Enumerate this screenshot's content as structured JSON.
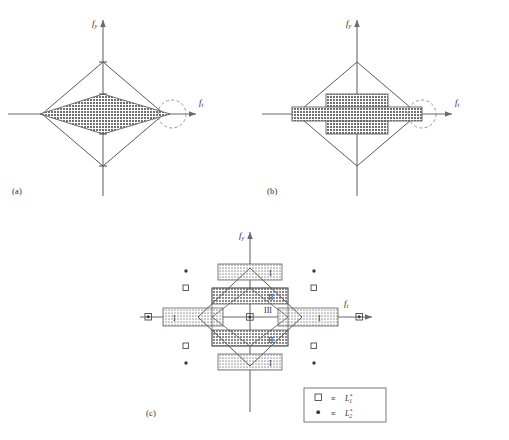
{
  "figure": {
    "type": "diagram",
    "caption_panels": [
      "(a)",
      "(b)",
      "(c)"
    ],
    "axis": {
      "x_label_base": "f",
      "x_label_sub": "t",
      "y_label_base": "f",
      "y_label_sub": "y"
    },
    "panels": [
      {
        "id": "a",
        "label": "(a)",
        "description": "Outer diamond envelope with an inner shaded lens/diamond region, dashed circle at right vertex",
        "outer_shape": "diamond",
        "inner_shape": "shaded-diamond",
        "dashed_circle": true
      },
      {
        "id": "b",
        "label": "(b)",
        "description": "Outer diamond envelope with an inner shaded cross/plus shaped region, dashed circle at right vertex",
        "outer_shape": "diamond",
        "inner_shape": "shaded-cross",
        "dashed_circle": true
      },
      {
        "id": "c",
        "label": "(c)",
        "description": "Outer diamond with hatched regions labelled I, II and an unhatched core region III, plus lattice markers",
        "outer_shape": "diamond",
        "region_labels": [
          "I",
          "II",
          "III"
        ],
        "region_label_list": [
          {
            "text": "I",
            "zone": "outer-band"
          },
          {
            "text": "II",
            "zone": "mid-band"
          },
          {
            "text": "III",
            "zone": "core"
          }
        ]
      }
    ],
    "legend": {
      "items": [
        {
          "marker": "open-square",
          "relation": "≡",
          "symbol_base": "L",
          "symbol_sub": "1",
          "symbol_sup": "*"
        },
        {
          "marker": "filled-dot",
          "relation": "≡",
          "symbol_base": "L",
          "symbol_sub": "2",
          "symbol_sup": "*"
        }
      ]
    },
    "colors": {
      "line": "#4a4a4a",
      "axis": "#6b6b6b",
      "hatch_dark": "#8a8a8a",
      "hatch_light": "#b9b9b9",
      "fill_dark": "#7e7e7e",
      "background": "#ffffff",
      "text": "#2b2b2b"
    }
  }
}
